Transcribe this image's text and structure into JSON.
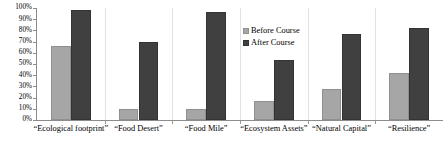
{
  "chart_data": {
    "type": "bar",
    "title": "",
    "xlabel": "",
    "ylabel": "",
    "ylim": [
      0,
      100
    ],
    "yticks": [
      "0%",
      "10%",
      "20%",
      "30%",
      "40%",
      "50%",
      "60%",
      "70%",
      "80%",
      "90%",
      "100%"
    ],
    "ytick_values": [
      0,
      10,
      20,
      30,
      40,
      50,
      60,
      70,
      80,
      90,
      100
    ],
    "grid": false,
    "legend_position": "center-top-right",
    "categories": [
      "“Ecological footprint”",
      "“Food Desert”",
      "“Food Mile”",
      "“Ecosystem Assets”",
      "“Natural Capital”",
      "“Resilience”"
    ],
    "series": [
      {
        "name": "Before Course",
        "color": "#a6a6a6",
        "values": [
          66,
          10,
          10,
          17,
          28,
          42
        ]
      },
      {
        "name": "After Course",
        "color": "#404040",
        "values": [
          98,
          70,
          96,
          54,
          77,
          82
        ]
      }
    ]
  },
  "legend": {
    "items": [
      {
        "label": "Before Course",
        "swatch": "before"
      },
      {
        "label": "After Course",
        "swatch": "after"
      }
    ]
  },
  "colors": {
    "before": "#a6a6a6",
    "after": "#404040",
    "axis": "#8c8c8c",
    "separator": "#e2e2e2",
    "background": "#ffffff",
    "text": "#000000"
  }
}
